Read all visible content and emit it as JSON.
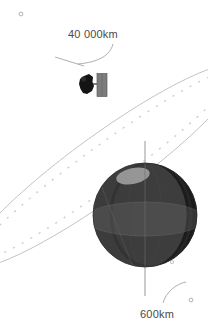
{
  "diagram": {
    "background_color": "#ffffff",
    "labels": {
      "apogee_altitude": "40 000km",
      "perigee_altitude": "600km"
    },
    "orbit": {
      "name": "elliptical-orbit-path",
      "stroke_color": "#c3c3c3",
      "dotted_trajectory_color": "#d2d2d2",
      "rotation_degrees": -36,
      "semi_major_axis_px": 168,
      "semi_minor_axis_px": 31,
      "center_x_px": 104,
      "center_y_px": 166,
      "apogee_marker_x_px": 21,
      "apogee_marker_y_px": 14,
      "perigee_marker_x_px": 191,
      "perigee_marker_y_px": 300
    },
    "planet": {
      "name": "planet-sphere",
      "center_x_px": 145,
      "center_y_px": 215,
      "radius_px": 52,
      "lit_color": "#3d3d3d",
      "shadow_color": "#1b1b1b",
      "terminator_color": "#2a2a2a",
      "equator_band_color": "#5a5a5a",
      "polar_cap_color": "#9d9d9d",
      "axis_color": "#aeaeae"
    },
    "satellite": {
      "name": "satellite",
      "body_x_px": 80,
      "body_y_px": 74,
      "body_color": "#141414",
      "panel_color": "#7c7c7c",
      "panel_edge_color": "#5e5e5e"
    },
    "leaders": {
      "apogee_leader_color": "#9a9a9a",
      "perigee_leader_color": "#9a9a9a"
    }
  }
}
